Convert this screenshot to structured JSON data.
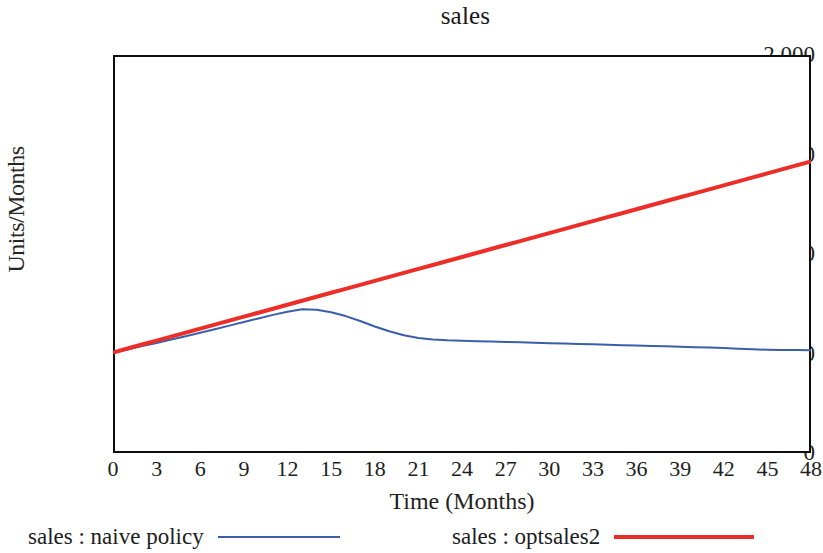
{
  "chart_data": {
    "type": "line",
    "title": "sales",
    "xlabel": "Time (Months)",
    "ylabel": "Units/Months",
    "xlim": [
      0,
      48
    ],
    "ylim": [
      0,
      2000
    ],
    "grid": false,
    "legend_position": "bottom",
    "x_ticks": [
      "0",
      "3",
      "6",
      "9",
      "12",
      "15",
      "18",
      "21",
      "24",
      "27",
      "30",
      "33",
      "36",
      "39",
      "42",
      "45",
      "48"
    ],
    "y_ticks": [
      "0",
      "500",
      "1,000",
      "1,500",
      "2,000"
    ],
    "x_tick_values": [
      0,
      3,
      6,
      9,
      12,
      15,
      18,
      21,
      24,
      27,
      30,
      33,
      36,
      39,
      42,
      45,
      48
    ],
    "y_tick_values": [
      0,
      500,
      1000,
      1500,
      2000
    ],
    "series": [
      {
        "name": "sales : naive policy",
        "color": "#3a5faa",
        "width": 2,
        "x": [
          0,
          1,
          2,
          3,
          4,
          5,
          6,
          7,
          8,
          9,
          10,
          11,
          12,
          13,
          14,
          15,
          16,
          17,
          18,
          19,
          20,
          21,
          22,
          23,
          24,
          25,
          26,
          27,
          28,
          29,
          30,
          31,
          32,
          33,
          34,
          35,
          36,
          37,
          38,
          39,
          40,
          41,
          42,
          43,
          44,
          45,
          46,
          47,
          48
        ],
        "values": [
          505,
          520,
          537,
          553,
          570,
          587,
          604,
          622,
          640,
          658,
          676,
          694,
          710,
          722,
          720,
          707,
          688,
          663,
          636,
          612,
          592,
          578,
          570,
          566,
          564,
          562,
          560,
          558,
          556,
          554,
          552,
          550,
          548,
          546,
          544,
          542,
          540,
          538,
          536,
          534,
          532,
          530,
          528,
          524,
          521,
          519,
          518,
          517,
          516
        ]
      },
      {
        "name": "sales : optsales2",
        "color": "#ec2d28",
        "width": 4,
        "x": [
          0,
          1,
          2,
          3,
          4,
          5,
          6,
          7,
          8,
          9,
          10,
          11,
          12,
          13,
          14,
          15,
          16,
          17,
          18,
          19,
          20,
          21,
          22,
          23,
          24,
          25,
          26,
          27,
          28,
          29,
          30,
          31,
          32,
          33,
          34,
          35,
          36,
          37,
          38,
          39,
          40,
          41,
          42,
          43,
          44,
          45,
          46,
          47,
          48
        ],
        "values": [
          505,
          525,
          545,
          565,
          585,
          605,
          625,
          645,
          665,
          685,
          705,
          725,
          745,
          765,
          785,
          805,
          825,
          845,
          865,
          885,
          905,
          925,
          945,
          965,
          985,
          1005,
          1025,
          1045,
          1065,
          1085,
          1105,
          1125,
          1145,
          1165,
          1185,
          1205,
          1225,
          1245,
          1265,
          1285,
          1305,
          1325,
          1345,
          1365,
          1385,
          1405,
          1425,
          1445,
          1465
        ]
      }
    ]
  },
  "legend": {
    "items": [
      {
        "label": "sales : naive policy",
        "swatch": "blue"
      },
      {
        "label": "sales : optsales2",
        "swatch": "red"
      }
    ]
  }
}
